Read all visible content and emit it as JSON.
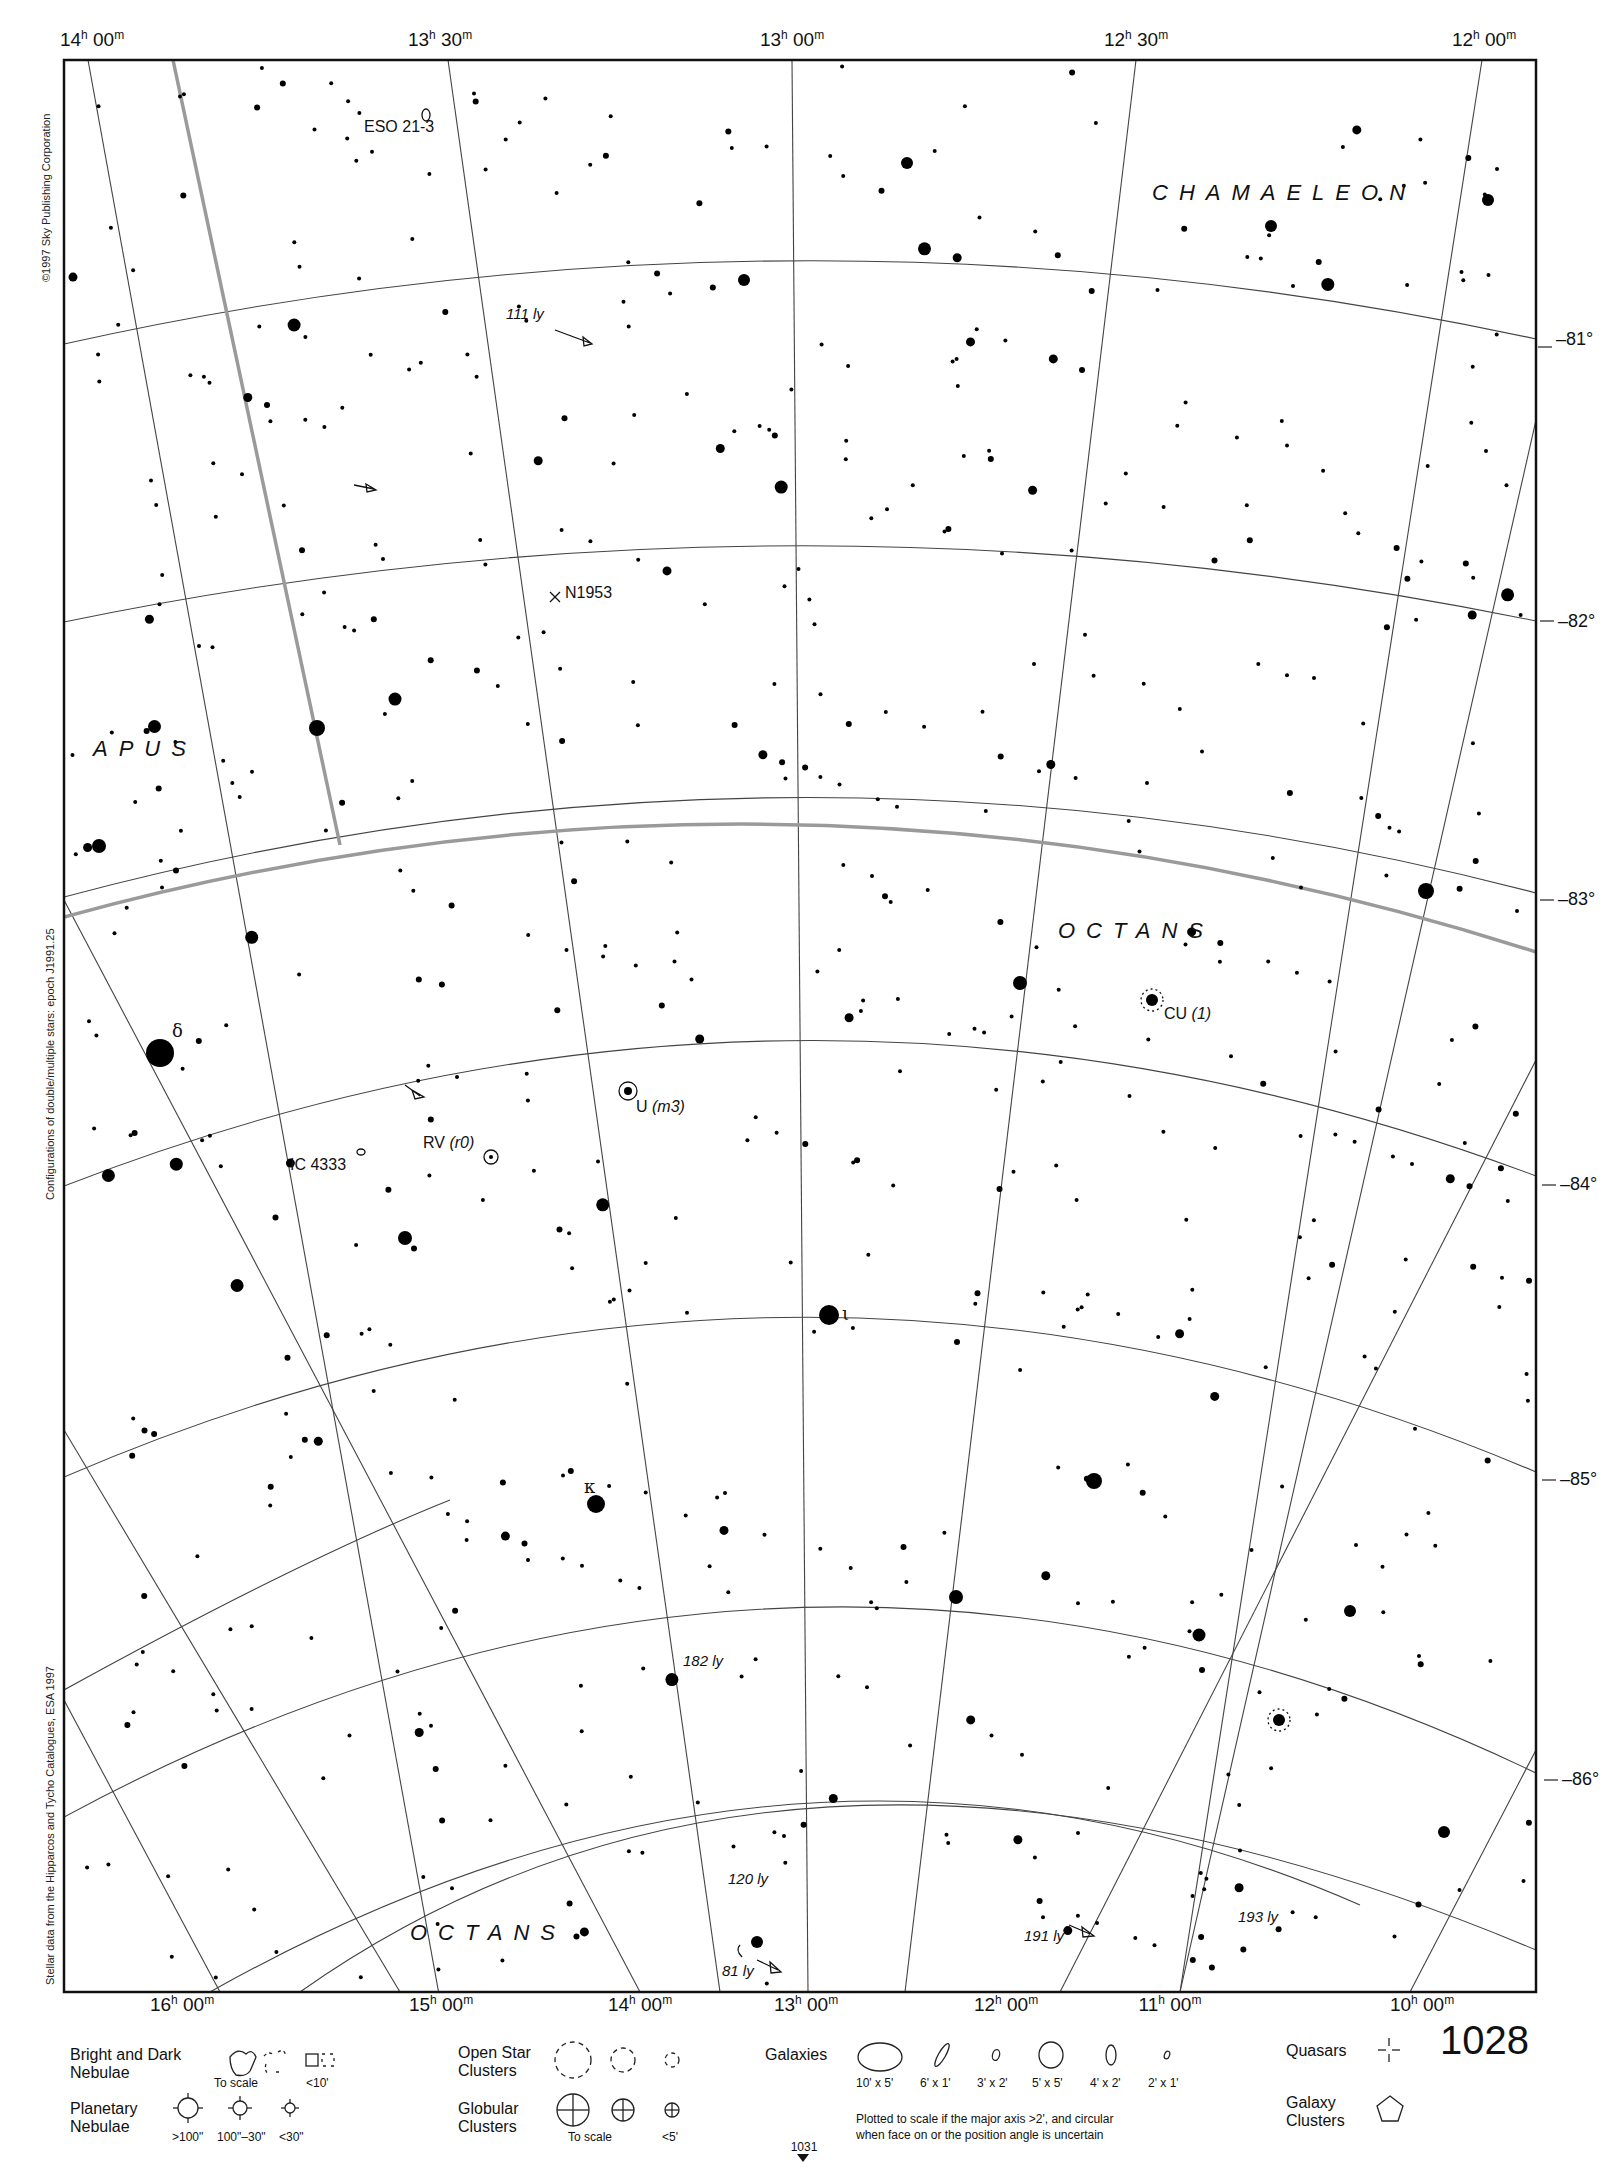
{
  "chart_data": {
    "type": "star-chart",
    "ra_top_labels": [
      "14h 00m",
      "13h 30m",
      "13h 00m",
      "12h 30m",
      "12h 00m"
    ],
    "ra_bottom_labels": [
      "16h 00m",
      "15h 00m",
      "14h 00m",
      "13h 00m",
      "12h 00m",
      "11h 00m",
      "10h 00m"
    ],
    "dec_labels": [
      "-81°",
      "-82°",
      "-83°",
      "-84°",
      "-85°",
      "-86°"
    ],
    "constellations": [
      "CHAMAELEON",
      "APUS",
      "OCTANS",
      "OCTANS"
    ],
    "objects": [
      "ESO 21-3",
      "N1953",
      "IC 4333",
      "RV (r0)",
      "U (m3)",
      "CU (1)"
    ],
    "star_designations": [
      "δ",
      "κ",
      "ι"
    ],
    "distances": [
      "111 ly",
      "182 ly",
      "120 ly",
      "81 ly",
      "191 ly",
      "193 ly"
    ]
  },
  "frame": {
    "ra_top": [
      {
        "h": "14",
        "m": "00",
        "x": 92
      },
      {
        "h": "13",
        "m": "30",
        "x": 440
      },
      {
        "h": "13",
        "m": "00",
        "x": 792
      },
      {
        "h": "12",
        "m": "30",
        "x": 1136
      },
      {
        "h": "12",
        "m": "00",
        "x": 1480
      }
    ],
    "ra_bottom": [
      {
        "h": "16",
        "m": "00",
        "x": 182
      },
      {
        "h": "15",
        "m": "00",
        "x": 441
      },
      {
        "h": "14",
        "m": "00",
        "x": 640
      },
      {
        "h": "13",
        "m": "00",
        "x": 806
      },
      {
        "h": "12",
        "m": "00",
        "x": 1006
      },
      {
        "h": "11",
        "m": "00",
        "x": 1170
      },
      {
        "h": "10",
        "m": "00",
        "x": 1422
      }
    ],
    "dec": [
      {
        "label": "–81°",
        "y": 339
      },
      {
        "label": "–82°",
        "y": 621
      },
      {
        "label": "–83°",
        "y": 893
      },
      {
        "label": "–84°",
        "y": 1176
      },
      {
        "label": "–85°",
        "y": 1472
      },
      {
        "label": "–86°",
        "y": 1773
      }
    ]
  },
  "side_notes": {
    "copyright": "©1997 Sky Publishing Corporation",
    "epoch": "Configurations of double/multiple stars: epoch J1991.25",
    "source": "Stellar data from the Hipparcos and Tycho Catalogues, ESA 1997"
  },
  "labels": {
    "chamaeleon": "CHAMAELEON",
    "apus": "APUS",
    "octans_mid": "OCTANS",
    "octans_bottom": "OCTANS",
    "eso": "ESO 21-3",
    "n1953": "N1953",
    "ic4333": "IC 4333",
    "rv_name": "RV",
    "rv_note": "(r0)",
    "u_name": "U",
    "u_note": "(m3)",
    "cu_name": "CU",
    "cu_note": "(1)",
    "ly111": "111 ly",
    "ly182": "182 ly",
    "ly120": "120 ly",
    "ly81": "81 ly",
    "ly191": "191 ly",
    "ly193": "193 ly",
    "delta": "δ",
    "kappa": "κ",
    "iota": "ι"
  },
  "legend": {
    "nebulae": "Bright and Dark\nNebulae",
    "nebulae_line1": "Bright and Dark",
    "nebulae_line2": "Nebulae",
    "to_scale": "To scale",
    "lt10": "<10'",
    "planetary_line1": "Planetary",
    "planetary_line2": "Nebulae",
    "pn_sizes": [
      ">100\"",
      "100\"–30\"",
      "<30\""
    ],
    "open_line1": "Open Star",
    "open_line2": "Clusters",
    "globular_line1": "Globular",
    "globular_line2": "Clusters",
    "glob_to_scale": "To scale",
    "lt5": "<5'",
    "galaxies": "Galaxies",
    "galaxy_sizes": [
      "10' x 5'",
      "6' x 1'",
      "3' x 2'",
      "5' x 5'",
      "4' x 2'",
      "2' x 1'"
    ],
    "galaxy_note1": "Plotted to scale if the major axis >2', and circular",
    "galaxy_note2": "when face on or the position angle is uncertain",
    "quasars": "Quasars",
    "galaxy_clusters_line1": "Galaxy",
    "galaxy_clusters_line2": "Clusters"
  },
  "page": {
    "number": "1028",
    "next_page": "1031"
  }
}
